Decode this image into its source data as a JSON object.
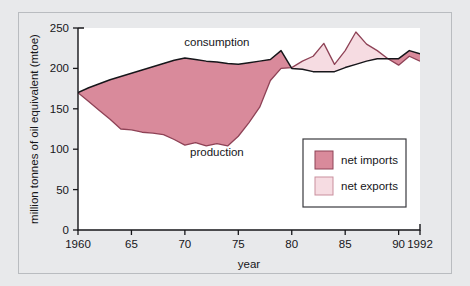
{
  "chart_data": {
    "type": "area",
    "title": "",
    "xlabel": "year",
    "ylabel": "million tonnes of oil equivalent (mtoe)",
    "xlim": [
      1960,
      1992
    ],
    "ylim": [
      0,
      250
    ],
    "grid": false,
    "legend_position": "inside-lower-right",
    "x": [
      1960,
      1961,
      1962,
      1963,
      1964,
      1965,
      1966,
      1967,
      1968,
      1969,
      1970,
      1971,
      1972,
      1973,
      1974,
      1975,
      1976,
      1977,
      1978,
      1979,
      1980,
      1981,
      1982,
      1983,
      1984,
      1985,
      1986,
      1987,
      1988,
      1989,
      1990,
      1991,
      1992
    ],
    "series": [
      {
        "name": "consumption",
        "values": [
          170,
          176,
          181,
          186,
          190,
          194,
          198,
          202,
          206,
          210,
          213,
          211,
          209,
          208,
          206,
          205,
          207,
          209,
          211,
          222,
          200,
          199,
          196,
          196,
          196,
          201,
          205,
          209,
          212,
          212,
          212,
          222,
          218
        ]
      },
      {
        "name": "production",
        "values": [
          170,
          159,
          148,
          137,
          125,
          124,
          121,
          120,
          118,
          112,
          105,
          108,
          104,
          107,
          104,
          116,
          133,
          152,
          185,
          200,
          201,
          209,
          215,
          231,
          205,
          222,
          245,
          230,
          222,
          212,
          204,
          215,
          209
        ]
      }
    ],
    "fills": [
      {
        "name": "net imports",
        "color": "#d98a9b",
        "meaning": "consumption above production"
      },
      {
        "name": "net exports",
        "color": "#f6dce2",
        "meaning": "production above consumption"
      }
    ],
    "yticks": [
      0,
      50,
      100,
      150,
      200,
      250
    ],
    "xticks": [
      {
        "value": 1960,
        "label": "1960"
      },
      {
        "value": 1965,
        "label": "65"
      },
      {
        "value": 1970,
        "label": "70"
      },
      {
        "value": 1975,
        "label": "75"
      },
      {
        "value": 1980,
        "label": "80"
      },
      {
        "value": 1985,
        "label": "85"
      },
      {
        "value": 1990,
        "label": "90"
      },
      {
        "value": 1992,
        "label": "1992"
      }
    ],
    "annotations": [
      {
        "text": "consumption",
        "x": 1973,
        "y": 228
      },
      {
        "text": "production",
        "x": 1973,
        "y": 92
      }
    ]
  },
  "legend": {
    "items": [
      {
        "label": "net imports",
        "swatch": "#d98a9b"
      },
      {
        "label": "net exports",
        "swatch": "#f6dce2"
      }
    ]
  },
  "colors": {
    "net_imports": "#d98a9b",
    "net_exports": "#f6dce2",
    "consumption_line": "#16161a",
    "production_line": "#8e4256",
    "page_background": "#e8e9eb",
    "plot_background": "#ffffff"
  }
}
